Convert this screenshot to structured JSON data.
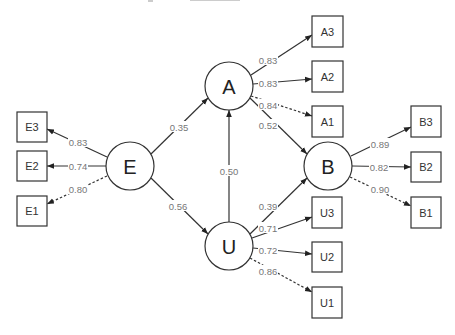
{
  "diagram": {
    "type": "structural-equation-model",
    "latent_nodes": [
      {
        "id": "A",
        "label": "A",
        "cx": 229,
        "cy": 86
      },
      {
        "id": "E",
        "label": "E",
        "cx": 130,
        "cy": 166
      },
      {
        "id": "B",
        "label": "B",
        "cx": 328,
        "cy": 166
      },
      {
        "id": "U",
        "label": "U",
        "cx": 229,
        "cy": 246
      }
    ],
    "observed_nodes": [
      {
        "id": "A3",
        "label": "A3",
        "x": 312,
        "y": 16
      },
      {
        "id": "A2",
        "label": "A2",
        "x": 312,
        "y": 61
      },
      {
        "id": "A1",
        "label": "A1",
        "x": 312,
        "y": 106
      },
      {
        "id": "E3",
        "label": "E3",
        "x": 17,
        "y": 127
      },
      {
        "id": "E2",
        "label": "E2",
        "x": 17,
        "y": 150
      },
      {
        "id": "E1",
        "label": "E1",
        "x": 17,
        "y": 196
      },
      {
        "id": "B3",
        "label": "B3",
        "x": 411,
        "y": 106
      },
      {
        "id": "B2",
        "label": "B2",
        "x": 411,
        "y": 152
      },
      {
        "id": "B1",
        "label": "B1",
        "x": 411,
        "y": 197
      },
      {
        "id": "U3",
        "label": "U3",
        "x": 312,
        "y": 197
      },
      {
        "id": "U2",
        "label": "U2",
        "x": 312,
        "y": 242
      },
      {
        "id": "U1",
        "label": "U1",
        "x": 312,
        "y": 287
      }
    ],
    "structural_paths": [
      {
        "from": "E",
        "to": "A",
        "coef": "0.35"
      },
      {
        "from": "E",
        "to": "U",
        "coef": "0.56"
      },
      {
        "from": "U",
        "to": "A",
        "coef": "0.50"
      },
      {
        "from": "A",
        "to": "B",
        "coef": "0.52"
      },
      {
        "from": "U",
        "to": "B",
        "coef": "0.39"
      }
    ],
    "loadings": [
      {
        "from": "A",
        "to": "A3",
        "coef": "0.83",
        "fixed": false
      },
      {
        "from": "A",
        "to": "A2",
        "coef": "0.83",
        "fixed": false
      },
      {
        "from": "A",
        "to": "A1",
        "coef": "0.84",
        "fixed": true
      },
      {
        "from": "E",
        "to": "E3",
        "coef": "0.83",
        "fixed": false
      },
      {
        "from": "E",
        "to": "E2",
        "coef": "0.74",
        "fixed": false
      },
      {
        "from": "E",
        "to": "E1",
        "coef": "0.80",
        "fixed": true
      },
      {
        "from": "B",
        "to": "B3",
        "coef": "0.89",
        "fixed": false
      },
      {
        "from": "B",
        "to": "B2",
        "coef": "0.82",
        "fixed": false
      },
      {
        "from": "B",
        "to": "B1",
        "coef": "0.90",
        "fixed": true
      },
      {
        "from": "U",
        "to": "U3",
        "coef": "0.71",
        "fixed": false
      },
      {
        "from": "U",
        "to": "U2",
        "coef": "0.72",
        "fixed": false
      },
      {
        "from": "U",
        "to": "U1",
        "coef": "0.86",
        "fixed": true
      }
    ]
  },
  "labels": {
    "A": "A",
    "E": "E",
    "B": "B",
    "U": "U",
    "A3": "A3",
    "A2": "A2",
    "A1": "A1",
    "E3": "E3",
    "E2": "E2",
    "E1": "E1",
    "B3": "B3",
    "B2": "B2",
    "B1": "B1",
    "U3": "U3",
    "U2": "U2",
    "U1": "U1",
    "E_A": "0.35",
    "E_U": "0.56",
    "U_A": "0.50",
    "A_B": "0.52",
    "U_B": "0.39",
    "A_A3": "0.83",
    "A_A2": "0.83",
    "A_A1": "0.84",
    "E_E3": "0.83",
    "E_E2": "0.74",
    "E_E1": "0.80",
    "B_B3": "0.89",
    "B_B2": "0.82",
    "B_B1": "0.90",
    "U_U3": "0.71",
    "U_U2": "0.72",
    "U_U1": "0.86"
  },
  "colors": {
    "line": "#333333",
    "label": "#777777",
    "background": "#ffffff"
  }
}
